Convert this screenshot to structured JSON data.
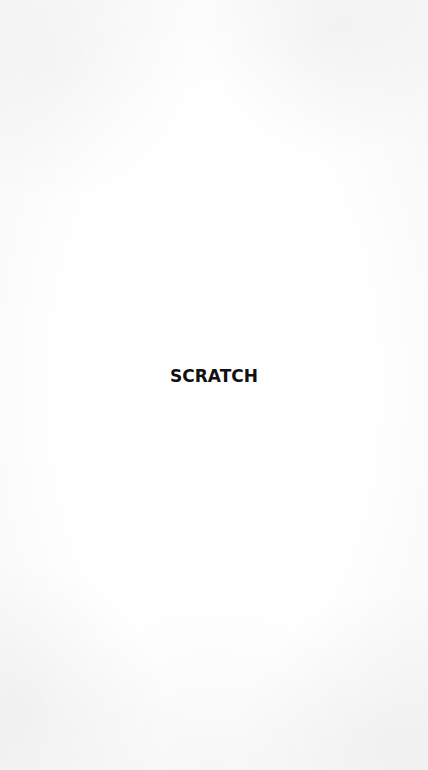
{
  "splash": {
    "title": "SCRATCH",
    "colors": {
      "background": "#fdfdfd",
      "title_text": "#111111"
    }
  }
}
